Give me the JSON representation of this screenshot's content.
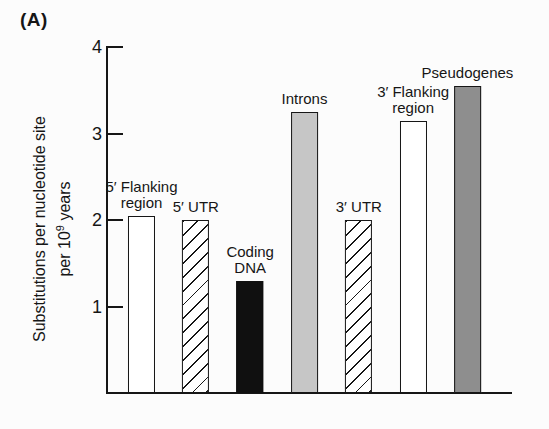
{
  "panel_label": "(A)",
  "chart_data": {
    "type": "bar",
    "title": "",
    "ylabel": {
      "line1": "Substitutions per nucleotide site",
      "line2_pre": "per 10",
      "line2_sup": "9",
      "line2_post": " years"
    },
    "categories": [
      "5′ Flanking region",
      "5′ UTR",
      "Coding DNA",
      "Introns",
      "3′ UTR",
      "3′ Flanking region",
      "Pseudogenes"
    ],
    "values": [
      2.05,
      2.0,
      1.3,
      3.25,
      2.0,
      3.15,
      3.55
    ],
    "bar_label_lines": [
      [
        "5′ Flanking",
        "region"
      ],
      [
        "5′ UTR"
      ],
      [
        "Coding",
        "DNA"
      ],
      [
        "Introns"
      ],
      [
        "3′ UTR"
      ],
      [
        "3′ Flanking",
        "region"
      ],
      [
        "Pseudogenes"
      ]
    ],
    "bar_styles": [
      "white",
      "hatched",
      "black",
      "light-gray",
      "hatched",
      "white",
      "dark-gray"
    ],
    "yticks": [
      4,
      3,
      2,
      1
    ],
    "ylim": [
      0,
      4
    ],
    "grid": false,
    "legend": "none",
    "colors": {
      "axis": "#161616",
      "bar_white": "#ffffff",
      "bar_black": "#101010",
      "bar_light_gray": "#c6c6c6",
      "bar_dark_gray": "#8e8e8e",
      "background": "#fcfcfc"
    }
  }
}
